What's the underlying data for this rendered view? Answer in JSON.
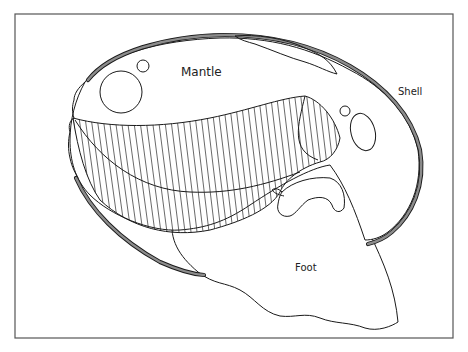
{
  "figure": {
    "labels": {
      "mantle": "Mantle",
      "shell": "Shell",
      "foot": "Foot"
    },
    "colors": {
      "shell_band": "#8c8c8c",
      "outline": "#1a1a1a",
      "frame": "#555555",
      "background": "#ffffff"
    }
  }
}
